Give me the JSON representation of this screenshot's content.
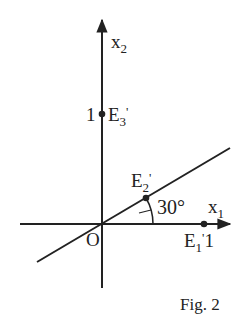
{
  "figure": {
    "caption": "Fig. 2",
    "axes": {
      "x_label": "x",
      "x_sub": "1",
      "y_label": "x",
      "y_sub": "2",
      "origin_label": "O"
    },
    "points": {
      "e1": {
        "label": "E",
        "sub": "1",
        "prime": "'",
        "value": "1"
      },
      "e2": {
        "label": "E",
        "sub": "2",
        "prime": "'"
      },
      "e3": {
        "label": "E",
        "sub": "3",
        "prime": "'",
        "value": "1"
      }
    },
    "angle_label": "30°",
    "colors": {
      "ink": "#222222",
      "background": "#ffffff"
    }
  }
}
